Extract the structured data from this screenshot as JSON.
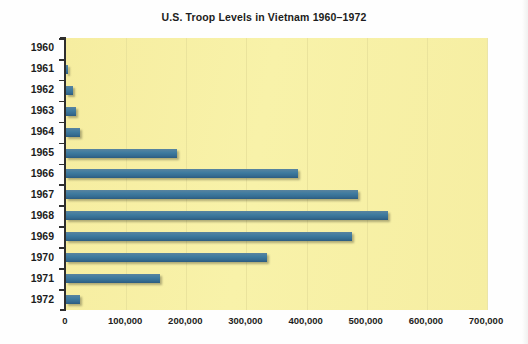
{
  "chart_data": {
    "type": "bar",
    "orientation": "horizontal",
    "title": "U.S. Troop Levels in Vietnam 1960–1972",
    "xlabel": "",
    "ylabel": "",
    "categories": [
      "1960",
      "1961",
      "1962",
      "1963",
      "1964",
      "1965",
      "1966",
      "1967",
      "1968",
      "1969",
      "1970",
      "1971",
      "1972"
    ],
    "values": [
      0,
      3000,
      11000,
      16000,
      23000,
      184000,
      385000,
      486000,
      536000,
      475000,
      335000,
      157000,
      24000
    ],
    "xlim": [
      0,
      700000
    ],
    "xticks": [
      0,
      100000,
      200000,
      300000,
      400000,
      500000,
      600000,
      700000
    ],
    "xtick_labels": [
      "0",
      "100,000",
      "200,000",
      "300,000",
      "400,000",
      "500,000",
      "600,000",
      "700,000"
    ],
    "grid": true,
    "legend": false,
    "bar_color": "#3f7b9f",
    "plot_background": "#f7f09f",
    "axis_color": "#2e2e2e",
    "text_color": "#1c1c20"
  }
}
